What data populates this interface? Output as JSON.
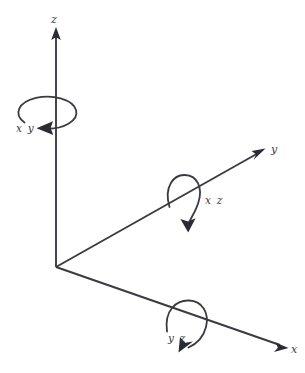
{
  "figure": {
    "kind": "3d-axis-rotation-diagram",
    "background_color": "#ffffff",
    "stroke_color": "#3a3a42",
    "arrow_fill_color": "#2b2b33",
    "origin": {
      "x": 56,
      "y": 267
    }
  },
  "axes": [
    {
      "id": "z",
      "label": "z",
      "label_x": 52,
      "label_y": 22,
      "from": {
        "x": 56,
        "y": 267
      },
      "to": {
        "x": 56,
        "y": 28
      },
      "direction": "up"
    },
    {
      "id": "y",
      "label": "y",
      "label_x": 272,
      "label_y": 152,
      "from": {
        "x": 56,
        "y": 267
      },
      "to": {
        "x": 265,
        "y": 149
      },
      "direction": "up-right"
    },
    {
      "id": "x",
      "label": "x",
      "label_x": 292,
      "label_y": 352,
      "from": {
        "x": 56,
        "y": 267
      },
      "to": {
        "x": 288,
        "y": 348
      },
      "direction": "down-right"
    }
  ],
  "rotations": [
    {
      "id": "xy",
      "label": "x y",
      "about_axis": "z",
      "label_x": 17,
      "label_y": 131,
      "shape": "ellipse-around-vertical-axis",
      "center": {
        "x": 47,
        "y": 113
      },
      "radius_x": 29,
      "radius_y": 16,
      "arrow_tip": {
        "x": 44,
        "y": 128
      },
      "arrow_direction": "left"
    },
    {
      "id": "xz",
      "label": "x z",
      "about_axis": "y",
      "label_x": 206,
      "label_y": 203,
      "shape": "loop-around-y-axis",
      "arrow_tip": {
        "x": 188,
        "y": 231
      },
      "arrow_direction": "down"
    },
    {
      "id": "yz",
      "label": "y z",
      "about_axis": "x",
      "label_x": 169,
      "label_y": 341,
      "shape": "loop-around-x-axis",
      "arrow_tip": {
        "x": 181,
        "y": 352
      },
      "arrow_direction": "down-left"
    }
  ]
}
